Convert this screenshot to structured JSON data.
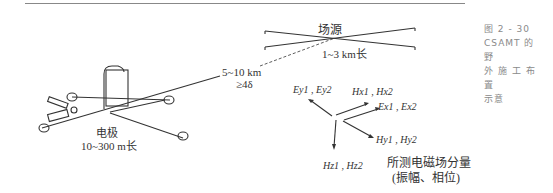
{
  "figure": {
    "caption_lines": [
      "图 2 - 30",
      "CSAMT 的 野",
      "外 施 工 布 置",
      "示意"
    ]
  },
  "labels": {
    "source_title": "场源",
    "source_length": "1~3 km长",
    "distance": "5~10 km",
    "distance_condition": "≥4δ",
    "electrode_title": "电极",
    "electrode_length": "10~300 m长",
    "components": {
      "ey": "Ey1 , Ey2",
      "hx": "Hx1 , Hx2",
      "ex": "Ex1 , Ex2",
      "hy": "Hy1 , Hy2",
      "hz": "Hz1 , Hz2"
    },
    "measured_title": "所测电磁场分量",
    "measured_sub": "(振幅、相位)"
  }
}
